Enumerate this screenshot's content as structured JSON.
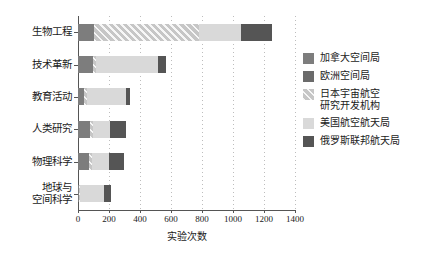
{
  "chart_data": {
    "type": "bar",
    "orientation": "horizontal",
    "stacked": true,
    "title": "",
    "xlabel": "实验次数",
    "ylabel": "",
    "xlim": [
      0,
      1400
    ],
    "xticks": [
      0,
      200,
      400,
      600,
      800,
      1000,
      1200,
      1400
    ],
    "xtick_labels": [
      "0",
      "200",
      "400",
      "600",
      "800",
      "1000",
      "1200",
      "1400"
    ],
    "grid": "vertical-dotted",
    "legend_position": "right",
    "categories": [
      "生物工程",
      "技术革新",
      "教育活动",
      "人类研究",
      "物理科学",
      "地球与\n空间科学"
    ],
    "series": [
      {
        "name": "加拿大空间局",
        "color": "#7d7d7d",
        "hatch": false,
        "values": [
          100,
          95,
          40,
          80,
          70,
          5
        ]
      },
      {
        "name": "欧洲空间局",
        "color": "#6b6b6b",
        "hatch": false,
        "values": [
          0,
          0,
          0,
          0,
          0,
          0
        ]
      },
      {
        "name": "日本宇宙航空\n研究开发机构",
        "color": "#c6c6c6",
        "hatch": true,
        "values": [
          680,
          20,
          20,
          15,
          20,
          10
        ]
      },
      {
        "name": "美国航空航天局",
        "color": "#d9d9d9",
        "hatch": false,
        "values": [
          270,
          400,
          250,
          110,
          110,
          155
        ]
      },
      {
        "name": "俄罗斯联邦航天局",
        "color": "#555555",
        "hatch": false,
        "values": [
          200,
          55,
          25,
          105,
          95,
          40
        ]
      }
    ],
    "totals": [
      1250,
      570,
      335,
      310,
      295,
      210
    ]
  },
  "legend": {
    "items": [
      {
        "label": "加拿大空间局"
      },
      {
        "label": "欧洲空间局"
      },
      {
        "label": "日本宇宙航空\n研究开发机构"
      },
      {
        "label": "美国航空航天局"
      },
      {
        "label": "俄罗斯联邦航天局"
      }
    ]
  }
}
